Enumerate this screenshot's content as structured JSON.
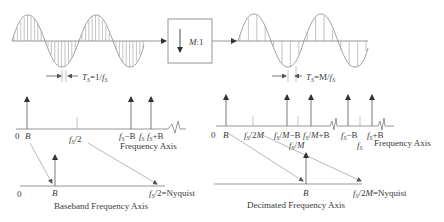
{
  "block": {
    "label": "M:1"
  },
  "left_time": {
    "period_label": "T_S=1/f_S"
  },
  "right_time": {
    "period_label": "T_S=M/f_S"
  },
  "left_freq": {
    "origin": "0",
    "ticks": [
      "B",
      "f_S/2",
      "f_S−B",
      "f_S",
      "f_S+B"
    ],
    "axis_label": "Frequency Axis"
  },
  "left_baseband": {
    "origin": "0",
    "ticks": [
      "B",
      "f_S/2=Nyquist"
    ],
    "axis_label": "Baseband Frequency Axis"
  },
  "right_freq": {
    "origin": "0",
    "ticks": [
      "B",
      "f_S/2M",
      "f_S/M−B",
      "f_S/M",
      "f_S/M+B",
      "f_S−B",
      "f_S",
      "f_S+B"
    ],
    "axis_label": "Frequency Axis"
  },
  "right_decimated": {
    "origin": "0",
    "ticks": [
      "B",
      "f_S/2M=Nyquist"
    ],
    "axis_label": "Decimated Frequency Axis"
  },
  "text": {
    "zero": "0",
    "B": "B",
    "M1": "M",
    "M1b": ":1",
    "Ts": "T",
    "S": "S",
    "f": "f",
    "eq1fs": "=1/",
    "eqMfs": "=M/",
    "half": "/2",
    "over2M": "/2",
    "M": "M",
    "overM": "/",
    "minusB": "−B",
    "plusB": "+B",
    "nyq": "=Nyquist",
    "freqAxis": "Frequency Axis",
    "baseband": "Baseband Frequency Axis",
    "decimated": "Decimated Frequency Axis"
  }
}
